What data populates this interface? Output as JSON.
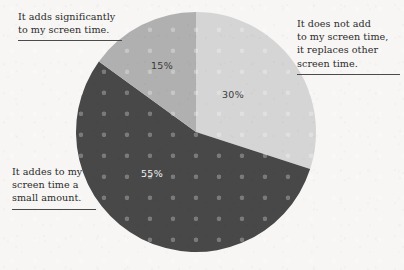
{
  "background_color": "#f7f6f4",
  "chart_data": {
    "type": "pie",
    "title": "",
    "subtitle": "",
    "xlabel": "",
    "ylabel": "",
    "legend_position": "callout-labels",
    "grid": false,
    "units": "percent",
    "total": 100,
    "center": {
      "x": 196,
      "y": 132
    },
    "radius": 120,
    "start_angle_deg": 0,
    "direction": "clockwise",
    "categories": [
      "It does not add to my screen time, it replaces other screen time.",
      "It addes to my screen time a small amount.",
      "It adds significantly to my screen time."
    ],
    "values": [
      30,
      55,
      15
    ],
    "value_labels": [
      "30%",
      "55%",
      "15%"
    ],
    "colors": [
      "#d5d5d5",
      "#484848",
      "#b0b0b0"
    ],
    "slices": [
      {
        "label": "It does not add to my screen time, it replaces other screen time.",
        "value": 30,
        "value_label": "30%",
        "color": "#d5d5d5",
        "start_angle_deg": 0,
        "end_angle_deg": 108,
        "value_label_color": "#3a3a3a",
        "value_label_x": 233,
        "value_label_y": 98
      },
      {
        "label": "It addes to my screen time a small amount.",
        "value": 55,
        "value_label": "55%",
        "color": "#484848",
        "start_angle_deg": 108,
        "end_angle_deg": 306,
        "value_label_color": "#f2f2f2",
        "value_label_x": 152,
        "value_label_y": 177
      },
      {
        "label": "It adds significantly to my screen time.",
        "value": 15,
        "value_label": "15%",
        "color": "#b0b0b0",
        "start_angle_deg": 306,
        "end_angle_deg": 360,
        "value_label_color": "#3a3a3a",
        "value_label_x": 162,
        "value_label_y": 69
      }
    ]
  },
  "annotations": {
    "top_left": {
      "text": "It adds significantly\nto my screen time.",
      "rule_color": "#4a4a4a"
    },
    "right": {
      "text": "It does not add\nto my screen time,\nit replaces other\nscreen time.",
      "rule_color": "#4a4a4a"
    },
    "bottom_left": {
      "text": "It addes to my\nscreen time a\nsmall amount.",
      "rule_color": "#4a4a4a"
    }
  }
}
